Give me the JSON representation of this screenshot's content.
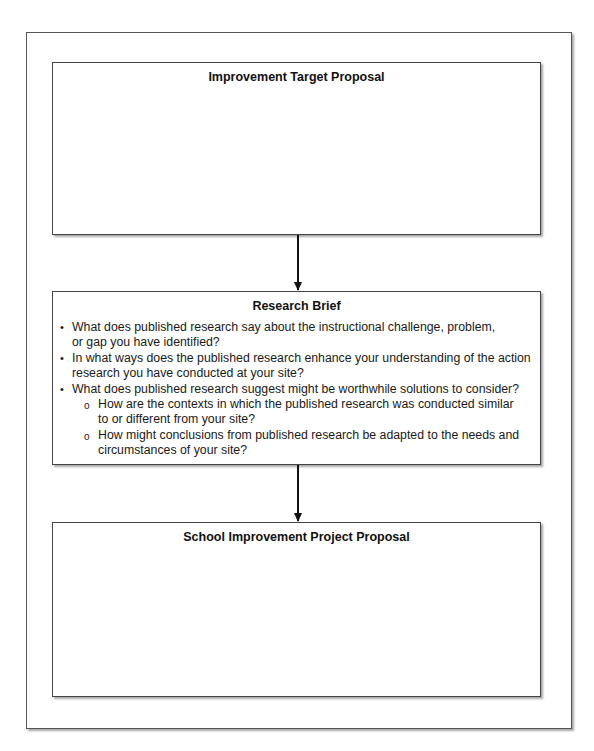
{
  "header_fragment": "",
  "diagram": {
    "boxes": [
      {
        "title": "Improvement Target Proposal",
        "items": []
      },
      {
        "title": "Research Brief",
        "items": [
          {
            "level": 1,
            "bullet": "•",
            "text": "What does published research say about the instructional challenge, problem, or gap you have identified?"
          },
          {
            "level": 1,
            "bullet": "•",
            "text": "In what ways does the published research enhance your understanding of the action research you have conducted at your site?"
          },
          {
            "level": 1,
            "bullet": "•",
            "text": "What does published research suggest might be worthwhile solutions to consider?"
          },
          {
            "level": 2,
            "bullet": "o",
            "text": "How are the contexts in which the published research was conducted similar to or different from your site?"
          },
          {
            "level": 2,
            "bullet": "o",
            "text": "How might conclusions from published research be adapted to the needs and circumstances of your site?"
          }
        ]
      },
      {
        "title": "School Improvement Project Proposal",
        "items": []
      }
    ],
    "arrows": [
      {
        "from": "Improvement Target Proposal",
        "to": "Research Brief"
      },
      {
        "from": "Research Brief",
        "to": "School Improvement Project Proposal"
      }
    ]
  },
  "lines": {
    "b2_l1a": "What does published research say about the instructional challenge, problem,",
    "b2_l1b": "or gap you have identified?",
    "b2_l2a": "In what ways does the published research enhance your understanding of the action",
    "b2_l2b": "research you have conducted at your site?",
    "b2_l3a": "What does published research suggest might be worthwhile solutions to consider?",
    "b2_l4a": "How are the contexts in which the published research was conducted similar",
    "b2_l4b": "to or different from your site?",
    "b2_l5a": "How might conclusions from published research be adapted to the needs and",
    "b2_l5b": "circumstances of your site?"
  }
}
